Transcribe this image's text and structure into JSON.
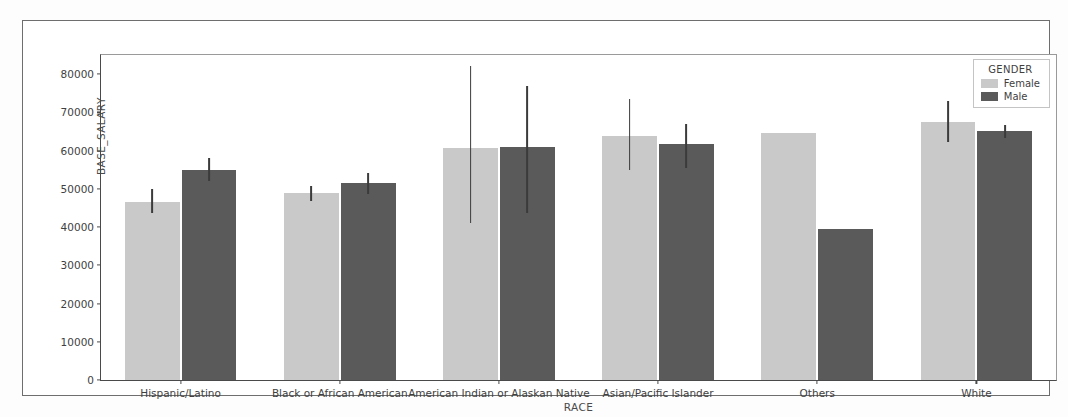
{
  "chart_data": {
    "type": "bar",
    "title": "",
    "xlabel": "RACE",
    "ylabel": "BASE_SALARY",
    "categories": [
      "Hispanic/Latino",
      "Black or African American",
      "American Indian or Alaskan Native",
      "Asian/Pacific Islander",
      "Others",
      "White"
    ],
    "series": [
      {
        "name": "Female",
        "color": "#c9c9c9",
        "values": [
          46500,
          48800,
          60600,
          63700,
          64700,
          67500
        ],
        "error_low": [
          43800,
          46900,
          41000,
          55000,
          null,
          62300
        ],
        "error_high": [
          50000,
          50800,
          82000,
          73600,
          null,
          73000
        ]
      },
      {
        "name": "Male",
        "color": "#5a5a5a",
        "values": [
          54800,
          51500,
          60900,
          61800,
          39500,
          65000
        ],
        "error_low": [
          52000,
          48600,
          43600,
          55500,
          null,
          63200
        ],
        "error_high": [
          58000,
          54200,
          77000,
          67000,
          null,
          66600
        ]
      }
    ],
    "ylim": [
      0,
      85000
    ],
    "yticks": [
      0,
      10000,
      20000,
      30000,
      40000,
      50000,
      60000,
      70000,
      80000
    ],
    "ytick_labels": [
      "0",
      "10000",
      "20000",
      "30000",
      "40000",
      "50000",
      "60000",
      "70000",
      "80000"
    ],
    "grid": false,
    "legend": {
      "title": "GENDER",
      "position": "upper right",
      "entries": [
        "Female",
        "Male"
      ]
    }
  }
}
